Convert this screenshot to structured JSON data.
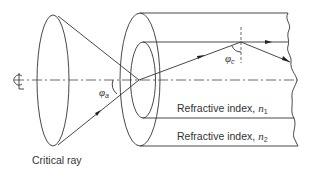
{
  "diagram": {
    "labels": {
      "critical_ray": "Critical ray",
      "core_index": "Refractive index, ",
      "core_symbol": "n",
      "core_subscript": "1",
      "cladding_index": "Refractive index, ",
      "cladding_symbol": "n",
      "cladding_subscript": "2",
      "acceptance_angle_symbol": "φ",
      "acceptance_angle_subscript": "a",
      "critical_angle_symbol": "φ",
      "critical_angle_subscript": "c",
      "centerline_symbol": "℄"
    }
  }
}
